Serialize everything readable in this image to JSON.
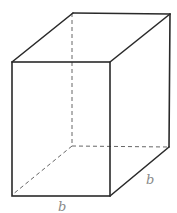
{
  "figure": {
    "type": "rectangular-prism",
    "colors": {
      "edge": "#2a2a2a",
      "hidden_edge": "#555555",
      "label": "#8a8a8a",
      "background": "#ffffff"
    },
    "labels": {
      "front_bottom": "b",
      "right_bottom": "b"
    }
  }
}
